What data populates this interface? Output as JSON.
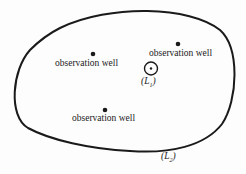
{
  "diagram": {
    "boundary_label": "(L",
    "boundary_sub": "2",
    "pumping_well_label": "(L",
    "pumping_well_sub": "1",
    "wells": [
      {
        "label": "observation well"
      },
      {
        "label": "observation well"
      },
      {
        "label": "observation well"
      }
    ]
  }
}
